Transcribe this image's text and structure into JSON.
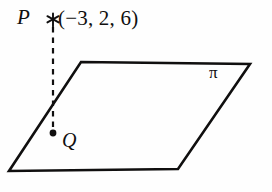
{
  "figure": {
    "background_color": "#fefefe",
    "ink_color": "#100f0f",
    "labels": {
      "point_p": "P",
      "point_p_coordinates": "(−3, 2, 6)",
      "point_q": "Q",
      "plane": "π"
    },
    "markers": {
      "p_marker": "asterisk-point-marker",
      "q_marker": "filled-dot-marker"
    },
    "geometry": {
      "plane_polygon": "81,62 250,64 178,169 9,171",
      "perpendicular_line": {
        "x": 53,
        "y_top": 26,
        "y_bottom": 133,
        "style": "dashed"
      },
      "q_dot": {
        "cx": 53,
        "cy": 133,
        "r": 3.4
      },
      "p_marker_center": {
        "cx": 53,
        "cy": 20
      }
    },
    "stroke_widths": {
      "plane_edge": 2.6,
      "dashed_line": 2.2,
      "marker": 1.9
    }
  }
}
